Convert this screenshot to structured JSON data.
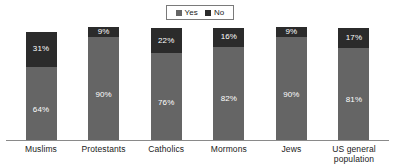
{
  "chart_data": {
    "type": "bar",
    "subtype": "stacked-100-percent",
    "title": "",
    "subtitle": "",
    "xlabel": "",
    "ylabel": "",
    "ylim": [
      0,
      100
    ],
    "grid": false,
    "legend_position": "top-center",
    "categories": [
      "Muslims",
      "Protestants",
      "Catholics",
      "Mormons",
      "Jews",
      "US general population"
    ],
    "series": [
      {
        "name": "Yes",
        "color": "#656565",
        "values": [
          64,
          90,
          76,
          82,
          90,
          81
        ],
        "labels": [
          "64%",
          "90%",
          "76%",
          "82%",
          "90%",
          "81%"
        ]
      },
      {
        "name": "No",
        "color": "#2b2b2b",
        "values": [
          31,
          9,
          22,
          16,
          9,
          17
        ],
        "labels": [
          "31%",
          "9%",
          "22%",
          "16%",
          "9%",
          "17%"
        ]
      }
    ]
  },
  "legend": {
    "items": [
      {
        "label": "Yes",
        "swatch_color": "#656565"
      },
      {
        "label": "No",
        "swatch_color": "#2b2b2b"
      }
    ]
  },
  "axis": {
    "baseline_color": "#8a8a8a"
  },
  "categories_display": [
    {
      "line1": "Muslims",
      "line2": ""
    },
    {
      "line1": "Protestants",
      "line2": ""
    },
    {
      "line1": "Catholics",
      "line2": ""
    },
    {
      "line1": "Mormons",
      "line2": ""
    },
    {
      "line1": "Jews",
      "line2": ""
    },
    {
      "line1": "US general",
      "line2": "population"
    }
  ]
}
